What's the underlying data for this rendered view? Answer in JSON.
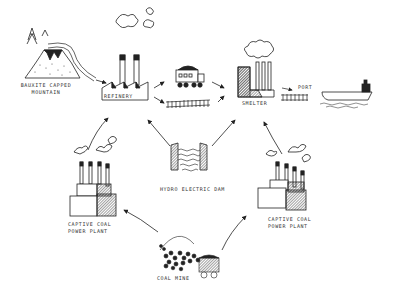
{
  "diagram": {
    "title": "",
    "nodes": {
      "mountain": {
        "line1": "Bauxite capped",
        "line2": "mountain"
      },
      "refinery": {
        "label": "Refinery"
      },
      "smelter": {
        "label": "Smelter"
      },
      "port": {
        "label": "Port"
      },
      "hydro": {
        "label": "Hydro electric dam"
      },
      "plant_left": {
        "line1": "Captive coal",
        "line2": "power plant"
      },
      "plant_right": {
        "line1": "Captive coal",
        "line2": "power plant"
      },
      "coal_mine": {
        "label": "Coal mine"
      }
    },
    "edges": [
      {
        "from": "mountain",
        "to": "refinery",
        "via": "conveyor"
      },
      {
        "from": "refinery",
        "to": "truck"
      },
      {
        "from": "refinery",
        "to": "rail"
      },
      {
        "from": "truck",
        "to": "smelter"
      },
      {
        "from": "rail",
        "to": "smelter"
      },
      {
        "from": "smelter",
        "to": "port",
        "via": "rail"
      },
      {
        "from": "port",
        "to": "ship"
      },
      {
        "from": "hydro",
        "to": "refinery"
      },
      {
        "from": "hydro",
        "to": "smelter"
      },
      {
        "from": "plant_left",
        "to": "refinery"
      },
      {
        "from": "plant_right",
        "to": "smelter"
      },
      {
        "from": "coal_mine",
        "to": "plant_left"
      },
      {
        "from": "coal_mine",
        "to": "plant_right"
      }
    ],
    "colors": {
      "ink": "#222222",
      "hatch": "#555555",
      "paper": "#ffffff"
    }
  }
}
